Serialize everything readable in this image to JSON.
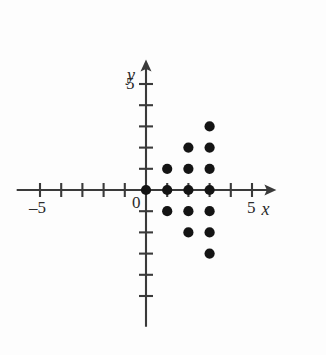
{
  "figure": {
    "kind": "coordinate-plane-scatter",
    "background_color": "#fdfdfd",
    "ink_color": "#2b2b2b",
    "dot_color": "#141414"
  },
  "axes": {
    "x_label": "x",
    "y_label": "y",
    "origin_label": "0",
    "x_tick_labels": [
      {
        "value": -5,
        "text": "–5"
      },
      {
        "value": 5,
        "text": "5"
      }
    ],
    "y_tick_labels": [
      {
        "value": 5,
        "text": "5"
      }
    ],
    "x_ticks": [
      -5,
      -4,
      -3,
      -2,
      -1,
      1,
      2,
      3,
      4,
      5
    ],
    "y_ticks": [
      1,
      2,
      3,
      4,
      5,
      -1,
      -2,
      -3,
      -4,
      -5
    ],
    "x_arrow": "right-arrowhead",
    "y_arrow": "up-arrowhead"
  },
  "chart_data": {
    "type": "scatter",
    "title": "",
    "xlabel": "x",
    "ylabel": "y",
    "xlim": [
      -6.2,
      6.6
    ],
    "ylim": [
      -6.6,
      6.6
    ],
    "grid": false,
    "legend": null,
    "x": [
      0,
      1,
      2,
      3,
      1,
      2,
      3,
      2,
      3,
      3,
      1,
      2,
      3,
      2,
      3,
      3
    ],
    "y": [
      0,
      0,
      0,
      0,
      1,
      1,
      1,
      2,
      2,
      3,
      -1,
      -1,
      -1,
      -2,
      -2,
      -3
    ],
    "points": [
      [
        0,
        0
      ],
      [
        1,
        0
      ],
      [
        2,
        0
      ],
      [
        3,
        0
      ],
      [
        1,
        1
      ],
      [
        2,
        1
      ],
      [
        3,
        1
      ],
      [
        2,
        2
      ],
      [
        3,
        2
      ],
      [
        3,
        3
      ],
      [
        1,
        -1
      ],
      [
        2,
        -1
      ],
      [
        3,
        -1
      ],
      [
        2,
        -2
      ],
      [
        3,
        -2
      ],
      [
        3,
        -3
      ]
    ],
    "point_count": 16,
    "marker": "filled-circle",
    "marker_color": "#141414"
  }
}
